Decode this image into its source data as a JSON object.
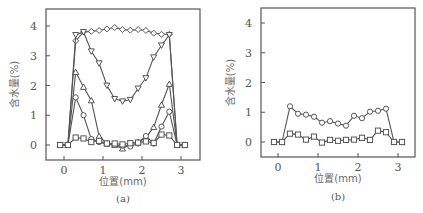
{
  "chart_data": [
    {
      "panel": "a",
      "type": "line",
      "title": "",
      "sublabel": "(a)",
      "xlabel": "位置(mm)",
      "ylabel": "含水量(%)",
      "xlim": [
        -0.3,
        3.4
      ],
      "ylim": [
        -0.5,
        4.5
      ],
      "xticks": [
        0,
        1,
        2,
        3
      ],
      "yticks": [
        0,
        1,
        2,
        3,
        4
      ],
      "grid": false,
      "legend": "none",
      "x": [
        -0.1,
        0.1,
        0.3,
        0.5,
        0.7,
        0.9,
        1.1,
        1.3,
        1.5,
        1.7,
        1.9,
        2.1,
        2.3,
        2.5,
        2.7,
        2.9,
        3.1
      ],
      "series": [
        {
          "name": "diamond",
          "marker": "diamond",
          "values": [
            0,
            0,
            3.5,
            3.8,
            3.82,
            3.85,
            3.9,
            3.95,
            3.88,
            3.86,
            3.88,
            3.85,
            3.76,
            3.72,
            3.72,
            0,
            0
          ]
        },
        {
          "name": "triangle-down",
          "marker": "triangle-down",
          "values": [
            0,
            0,
            3.7,
            3.8,
            3.15,
            2.75,
            2.0,
            1.55,
            1.47,
            1.52,
            1.9,
            2.25,
            2.95,
            3.35,
            3.7,
            0,
            0
          ]
        },
        {
          "name": "triangle-up",
          "marker": "triangle-up",
          "values": [
            0,
            0,
            2.45,
            1.95,
            1.5,
            0.3,
            0.05,
            0.0,
            -0.12,
            0.05,
            0.1,
            0.25,
            0.6,
            1.35,
            2.05,
            0,
            0
          ]
        },
        {
          "name": "circle",
          "marker": "circle",
          "values": [
            0,
            0,
            1.6,
            1.0,
            0.2,
            0.1,
            0.03,
            0.0,
            -0.02,
            -0.05,
            0.05,
            0.3,
            0.05,
            0.62,
            1.12,
            0,
            0
          ]
        },
        {
          "name": "square",
          "marker": "square",
          "values": [
            0,
            0,
            0.25,
            0.22,
            0.1,
            0.14,
            0.05,
            0.05,
            0.02,
            0.06,
            0.08,
            0.12,
            0.07,
            0.35,
            0.32,
            0,
            0
          ]
        }
      ]
    },
    {
      "panel": "b",
      "type": "line",
      "title": "",
      "sublabel": "(b)",
      "xlabel": "位置(mm)",
      "ylabel": "含水量(%)",
      "xlim": [
        -0.3,
        3.4
      ],
      "ylim": [
        -0.5,
        4.5
      ],
      "xticks": [
        0,
        1,
        2,
        3
      ],
      "yticks": [
        0,
        1,
        2,
        3,
        4
      ],
      "grid": false,
      "legend": "none",
      "x": [
        -0.1,
        0.1,
        0.3,
        0.5,
        0.7,
        0.9,
        1.1,
        1.3,
        1.5,
        1.7,
        1.9,
        2.1,
        2.3,
        2.5,
        2.7,
        2.9,
        3.1
      ],
      "series": [
        {
          "name": "circle",
          "marker": "circle",
          "values": [
            0,
            0,
            1.2,
            0.95,
            0.92,
            0.85,
            0.65,
            0.7,
            0.62,
            0.55,
            0.88,
            0.8,
            1.02,
            1.05,
            1.12,
            0,
            0
          ]
        },
        {
          "name": "square",
          "marker": "square",
          "values": [
            0,
            0,
            0.28,
            0.25,
            0.08,
            0.18,
            -0.02,
            0.07,
            0.04,
            0.07,
            0.08,
            0.14,
            0.07,
            0.38,
            0.33,
            0,
            0
          ]
        }
      ]
    }
  ]
}
